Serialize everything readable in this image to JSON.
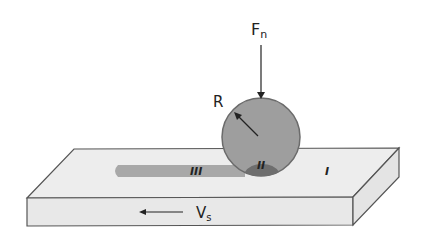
{
  "diagram": {
    "labels": {
      "force": "F",
      "force_sub": "n",
      "radius": "R",
      "velocity": "V",
      "velocity_sub": "s",
      "region_1": "I",
      "region_2": "II",
      "region_3": "III"
    },
    "colors": {
      "plate_face": "#ededed",
      "plate_edge": "#555555",
      "ball_fill": "#9e9e9e",
      "ball_stroke": "#6b6b6b",
      "track": "#a8a8a8",
      "contact": "#6e6e6e"
    }
  }
}
